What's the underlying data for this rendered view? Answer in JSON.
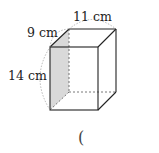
{
  "diagram": {
    "type": "rectangular prism",
    "labels": {
      "depth": "9 cm",
      "width": "11 cm",
      "height": "14 cm"
    },
    "shaded_face": "left side face",
    "answer_blank": "("
  },
  "colors": {
    "edge": "#222222",
    "hidden_edge": "#555555",
    "shade": "#d9d9d9",
    "arc": "#999999"
  }
}
